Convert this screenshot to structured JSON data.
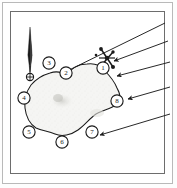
{
  "figure": {
    "kind": "survey-sketch-map",
    "background_color": "#ffffff",
    "frame_color": "#6d6d6d",
    "outer_frame_color": "#b9b9b9",
    "ink_color": "#1b1b1b"
  },
  "north_arrow": {
    "name": "north-arrow",
    "description": "slender tapered needle pointing up",
    "base_marker": "circled-cross-survey-point",
    "x": 30,
    "y": 28,
    "height": 42
  },
  "structure_symbol": {
    "name": "structure-symbol",
    "description": "dark crossed structure mark beside station 1",
    "x": 108,
    "y": 58
  },
  "outcrop": {
    "name": "outcrop-polygon",
    "fill": "#f4f4f2",
    "stroke": "#1b1b1b",
    "stipple": true
  },
  "stations": [
    {
      "id": "1",
      "label": "1",
      "x": 103,
      "y": 68
    },
    {
      "id": "2",
      "label": "2",
      "x": 66,
      "y": 73
    },
    {
      "id": "3",
      "label": "3",
      "x": 49,
      "y": 63
    },
    {
      "id": "4",
      "label": "4",
      "x": 24,
      "y": 98
    },
    {
      "id": "5",
      "label": "5",
      "x": 29,
      "y": 132
    },
    {
      "id": "6",
      "label": "6",
      "x": 62,
      "y": 142
    },
    {
      "id": "7",
      "label": "7",
      "x": 92,
      "y": 132
    },
    {
      "id": "8",
      "label": "8",
      "x": 117,
      "y": 101
    }
  ],
  "direction_arrows": [
    {
      "id": "arrow-1",
      "from_x": 165,
      "from_y": 23,
      "to_x": 61,
      "to_y": 74
    },
    {
      "id": "arrow-2",
      "from_x": 168,
      "from_y": 41,
      "to_x": 112,
      "to_y": 61
    },
    {
      "id": "arrow-3",
      "from_x": 170,
      "from_y": 62,
      "to_x": 116,
      "to_y": 76
    },
    {
      "id": "arrow-4",
      "from_x": 170,
      "from_y": 87,
      "to_x": 127,
      "to_y": 99
    },
    {
      "id": "arrow-5",
      "from_x": 170,
      "from_y": 114,
      "to_x": 100,
      "to_y": 135
    }
  ]
}
